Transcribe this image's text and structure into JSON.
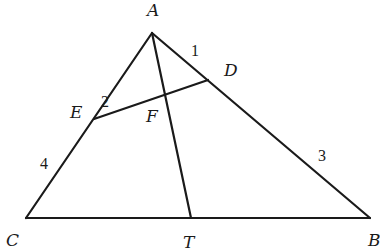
{
  "diagram": {
    "type": "triangle-geometry",
    "points": {
      "A": {
        "label": "A",
        "x": 152,
        "y": 33,
        "lx": 147,
        "ly": 16
      },
      "B": {
        "label": "B",
        "x": 370,
        "y": 218,
        "lx": 368,
        "ly": 246
      },
      "C": {
        "label": "C",
        "x": 26,
        "y": 218,
        "lx": 6,
        "ly": 246
      },
      "D": {
        "label": "D",
        "x": 208,
        "y": 80,
        "lx": 224,
        "ly": 76
      },
      "E": {
        "label": "E",
        "x": 94,
        "y": 119,
        "lx": 70,
        "ly": 118
      },
      "F": {
        "label": "F",
        "x": 166,
        "y": 96,
        "lx": 146,
        "ly": 122
      },
      "T": {
        "label": "T",
        "x": 191,
        "y": 218,
        "lx": 183,
        "ly": 248
      }
    },
    "segments": [
      {
        "from": "A",
        "to": "B"
      },
      {
        "from": "A",
        "to": "C"
      },
      {
        "from": "C",
        "to": "B"
      },
      {
        "from": "A",
        "to": "T"
      },
      {
        "from": "E",
        "to": "D"
      }
    ],
    "length_labels": [
      {
        "text": "1",
        "segment": "AD",
        "x": 191,
        "y": 56
      },
      {
        "text": "2",
        "segment": "AE",
        "x": 101,
        "y": 107
      },
      {
        "text": "4",
        "segment": "EC",
        "x": 40,
        "y": 169
      },
      {
        "text": "3",
        "segment": "DB",
        "x": 318,
        "y": 161
      }
    ]
  }
}
